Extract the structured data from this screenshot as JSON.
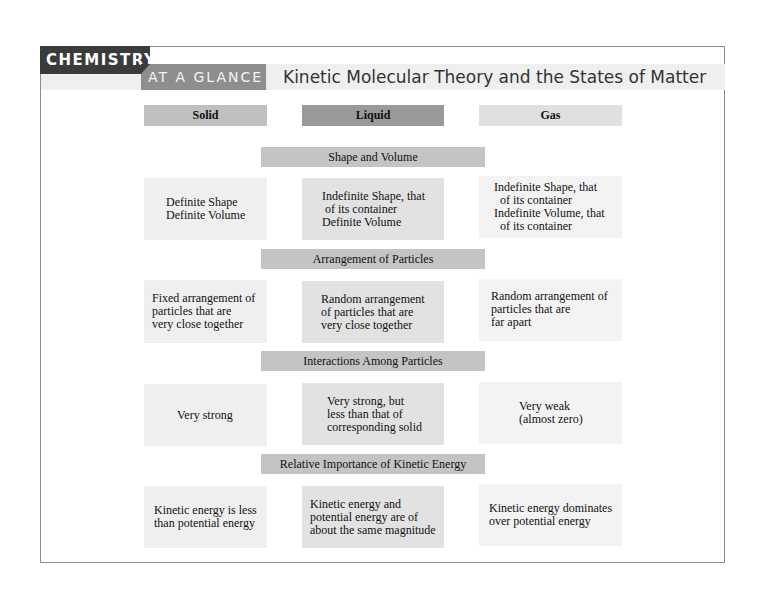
{
  "header": {
    "category_tab": "CHEMISTRY",
    "subtitle_tab": "AT A GLANCE",
    "title": "Kinetic Molecular Theory and the States of Matter"
  },
  "columns": [
    {
      "label": "Solid",
      "color": "#c0c0c0"
    },
    {
      "label": "Liquid",
      "color": "#9a9a9a"
    },
    {
      "label": "Gas",
      "color": "#e0e0e0"
    }
  ],
  "sections": [
    {
      "title": "Shape and Volume",
      "cells": [
        "Definite Shape\nDefinite Volume",
        "Indefinite Shape, that\n of its container\nDefinite Volume",
        "Indefinite Shape, that\n  of its container\nIndefinite Volume, that\n  of its container"
      ]
    },
    {
      "title": "Arrangement of Particles",
      "cells": [
        "Fixed arrangement of\nparticles that are\nvery close together",
        "Random arrangement\nof particles that are\nvery close together",
        "Random arrangement of\nparticles that are\nfar apart"
      ]
    },
    {
      "title": "Interactions Among Particles",
      "cells": [
        "Very strong",
        "Very strong, but\nless than that of\ncorresponding solid",
        "Very weak\n(almost zero)"
      ]
    },
    {
      "title": "Relative Importance of Kinetic Energy",
      "cells": [
        "Kinetic energy is less\nthan potential energy",
        "Kinetic energy and\npotential energy are of\nabout the same magnitude",
        "Kinetic energy dominates\nover potential energy"
      ]
    }
  ]
}
